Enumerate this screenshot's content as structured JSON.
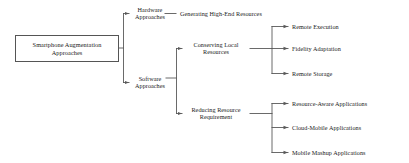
{
  "diagram": {
    "type": "horizontal-tree",
    "background_color": "#ffffff",
    "line_color": "#595959",
    "text_color": "#1a1a1a",
    "root": {
      "label": "Smartphone Augmentation\nApproaches"
    },
    "level2": [
      {
        "label": "Hardware\nApproaches"
      },
      {
        "label": "Software\nApproaches"
      }
    ],
    "level3": [
      {
        "label": "Generating High-End Resources"
      },
      {
        "label": "Conserving Local\nResources"
      },
      {
        "label": "Reducing Resource\nRequirement"
      }
    ],
    "level4_conserving": [
      {
        "label": "Remote Execution"
      },
      {
        "label": "Fidelity Adaptation"
      },
      {
        "label": "Remote Storage"
      }
    ],
    "level4_reducing": [
      {
        "label": "Resource-Aware Applications"
      },
      {
        "label": "Cloud-Mobile Applications"
      },
      {
        "label": "Mobile Mashup Applications"
      }
    ]
  }
}
